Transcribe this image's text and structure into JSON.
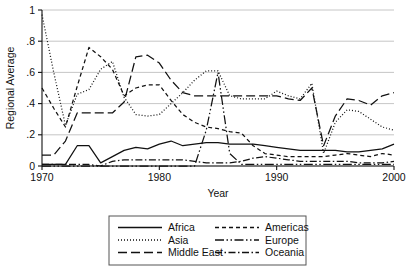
{
  "chart_data": {
    "type": "line",
    "title": "",
    "xlabel": "Year",
    "ylabel": "Regional Average",
    "xlim": [
      1970,
      2000
    ],
    "ylim": [
      0,
      1
    ],
    "xticks": [
      1970,
      1980,
      1990,
      2000
    ],
    "xtick_labels": [
      "1970",
      "1980",
      "1990",
      "2000"
    ],
    "yticks": [
      0,
      0.2,
      0.4,
      0.6,
      0.8,
      1
    ],
    "ytick_labels": [
      "0",
      ".2",
      ".4",
      ".6",
      ".8",
      "1"
    ],
    "grid": "horizontal",
    "legend_position": "below-center",
    "x": [
      1970,
      1971,
      1972,
      1973,
      1974,
      1975,
      1976,
      1977,
      1978,
      1979,
      1980,
      1981,
      1982,
      1983,
      1984,
      1985,
      1986,
      1987,
      1988,
      1989,
      1990,
      1991,
      1992,
      1993,
      1994,
      1995,
      1996,
      1997,
      1998,
      1999,
      2000
    ],
    "series": [
      {
        "name": "Africa",
        "dash": "solid",
        "values": [
          0.01,
          0.01,
          0.01,
          0.13,
          0.13,
          0.02,
          0.06,
          0.1,
          0.12,
          0.11,
          0.14,
          0.16,
          0.13,
          0.14,
          0.15,
          0.15,
          0.14,
          0.14,
          0.14,
          0.13,
          0.12,
          0.11,
          0.1,
          0.1,
          0.1,
          0.1,
          0.09,
          0.09,
          0.1,
          0.11,
          0.14
        ]
      },
      {
        "name": "Asia",
        "dash": "dotted",
        "values": [
          0.97,
          0.6,
          0.26,
          0.46,
          0.49,
          0.62,
          0.67,
          0.44,
          0.33,
          0.32,
          0.33,
          0.4,
          0.47,
          0.55,
          0.61,
          0.61,
          0.45,
          0.43,
          0.43,
          0.43,
          0.48,
          0.45,
          0.43,
          0.53,
          0.08,
          0.28,
          0.36,
          0.35,
          0.3,
          0.25,
          0.23
        ]
      },
      {
        "name": "Middle East",
        "dash": "longdash",
        "values": [
          0.07,
          0.07,
          0.16,
          0.34,
          0.34,
          0.34,
          0.34,
          0.41,
          0.7,
          0.71,
          0.66,
          0.55,
          0.47,
          0.45,
          0.45,
          0.45,
          0.45,
          0.45,
          0.45,
          0.45,
          0.45,
          0.43,
          0.42,
          0.5,
          0.13,
          0.32,
          0.43,
          0.42,
          0.39,
          0.45,
          0.47
        ]
      },
      {
        "name": "Americas",
        "dash": "shortdash",
        "values": [
          0.5,
          0.37,
          0.25,
          0.51,
          0.76,
          0.7,
          0.62,
          0.45,
          0.5,
          0.52,
          0.52,
          0.42,
          0.33,
          0.28,
          0.25,
          0.24,
          0.22,
          0.21,
          0.13,
          0.08,
          0.07,
          0.06,
          0.06,
          0.06,
          0.06,
          0.07,
          0.08,
          0.07,
          0.06,
          0.08,
          0.07
        ]
      },
      {
        "name": "Europe",
        "dash": "dashdotdot",
        "values": [
          0.0,
          0.0,
          0.0,
          0.0,
          0.0,
          0.0,
          0.0,
          0.0,
          0.0,
          0.0,
          0.0,
          0.0,
          0.0,
          0.0,
          0.23,
          0.6,
          0.08,
          0.01,
          0.01,
          0.01,
          0.01,
          0.01,
          0.01,
          0.01,
          0.01,
          0.01,
          0.01,
          0.01,
          0.01,
          0.01,
          0.01
        ]
      },
      {
        "name": "Oceania",
        "dash": "dashdot",
        "values": [
          0.01,
          0.01,
          0.01,
          0.01,
          0.01,
          0.0,
          0.03,
          0.04,
          0.04,
          0.04,
          0.04,
          0.04,
          0.04,
          0.03,
          0.02,
          0.02,
          0.02,
          0.03,
          0.05,
          0.06,
          0.05,
          0.04,
          0.03,
          0.03,
          0.03,
          0.03,
          0.03,
          0.02,
          0.02,
          0.02,
          0.03
        ]
      }
    ],
    "legend_entries": [
      {
        "label": "Africa",
        "dash": "solid"
      },
      {
        "label": "Americas",
        "dash": "shortdash"
      },
      {
        "label": "Asia",
        "dash": "dotted"
      },
      {
        "label": "Europe",
        "dash": "dashdotdot"
      },
      {
        "label": "Middle East",
        "dash": "longdash"
      },
      {
        "label": "Oceania",
        "dash": "dashdot"
      }
    ],
    "colors": {
      "line": "#111111",
      "grid": "#b8b8b8",
      "axis": "#111111",
      "background": "#ffffff",
      "legend_border": "#555555"
    }
  }
}
